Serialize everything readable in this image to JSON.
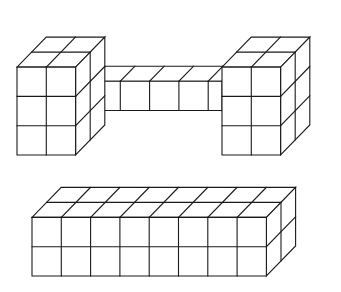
{
  "diagram": {
    "stroke_color": "#1a1a1a",
    "background_color": "#ffffff",
    "cube_size": 29.3,
    "depth_vector": [
      14.6,
      -15.0
    ],
    "figures": [
      {
        "name": "dumbbell-structure",
        "parts": [
          {
            "name": "left-block",
            "origin": [
              17,
              155
            ],
            "cols": 2,
            "rows": 3,
            "depth": 2
          },
          {
            "name": "bridge",
            "origin": [
              76.4,
              125.5
            ],
            "cols": 5,
            "rows": 1,
            "depth": 1,
            "depth_offset": 1,
            "length_px": 131
          },
          {
            "name": "right-block",
            "origin": [
              222,
              155
            ],
            "cols": 2,
            "rows": 3,
            "depth": 2
          }
        ]
      },
      {
        "name": "long-bar",
        "parts": [
          {
            "name": "bar",
            "origin": [
              32,
              276
            ],
            "cols": 8,
            "rows": 2,
            "depth": 2
          }
        ]
      }
    ]
  }
}
